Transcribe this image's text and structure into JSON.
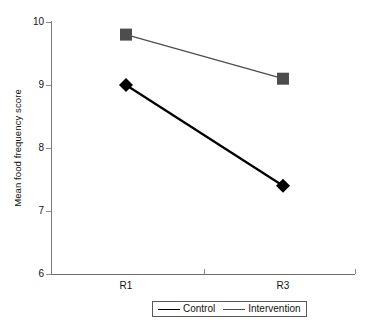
{
  "chart_data": {
    "type": "line",
    "title": "",
    "xlabel": "",
    "ylabel": "Mean food frequency score",
    "categories": [
      "R1",
      "R3"
    ],
    "x": [
      1,
      2
    ],
    "ylim": [
      6,
      10
    ],
    "yticks": [
      6,
      7,
      8,
      9,
      10
    ],
    "ytick_labels": [
      "6",
      "7",
      "8",
      "9",
      "10"
    ],
    "xtick_labels": [
      "R1",
      "R3"
    ],
    "grid": false,
    "legend_position": "bottom-center",
    "series": [
      {
        "name": "Control",
        "values": [
          9.0,
          7.4
        ],
        "color": "#000000",
        "marker": "diamond",
        "line_width": 2.2
      },
      {
        "name": "Intervention",
        "values": [
          9.8,
          9.1
        ],
        "color": "#4d4d4d",
        "marker": "square",
        "line_width": 1.3
      }
    ]
  },
  "axes": {
    "y_title": "Mean food frequency score",
    "y_tick_labels": [
      "10",
      "9",
      "8",
      "7",
      "6"
    ],
    "x_tick_labels": [
      "R1",
      "R3"
    ]
  },
  "legend": {
    "items": [
      {
        "label": "Control",
        "marker": "diamond-marker",
        "color": "#000000"
      },
      {
        "label": "Intervention",
        "marker": "square-marker",
        "color": "#4d4d4d"
      }
    ]
  },
  "colors": {
    "control": "#000000",
    "intervention": "#4d4d4d",
    "axis": "#7a7a7a",
    "text": "#111111",
    "background": "#ffffff"
  }
}
